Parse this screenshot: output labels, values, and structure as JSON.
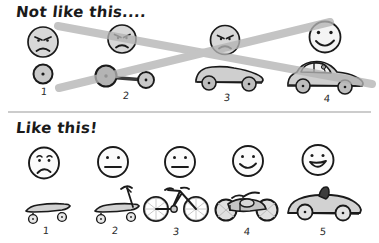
{
  "figure": {
    "title_top": "Not like this....",
    "title_bottom": "Like this!",
    "background_color": "#ffffff",
    "ink_color": "#1a1a1a",
    "fill_gray": "#bdbdbd",
    "cross_color": "#b4b4b4",
    "divider_color": "#9a9a9a"
  },
  "top_row": {
    "heading": "Not like this....",
    "crossed_out": true,
    "items": [
      {
        "number": "1",
        "vehicle": "single-wheel",
        "face": "angry",
        "face_icon": "angry-face-icon"
      },
      {
        "number": "2",
        "vehicle": "axle-two-wheels",
        "face": "angry",
        "face_icon": "angry-face-icon"
      },
      {
        "number": "3",
        "vehicle": "car-chassis",
        "face": "angry",
        "face_icon": "angry-face-icon"
      },
      {
        "number": "4",
        "vehicle": "finished-car",
        "face": "happy",
        "face_icon": "happy-face-icon"
      }
    ]
  },
  "bottom_row": {
    "heading": "Like this!",
    "crossed_out": false,
    "items": [
      {
        "number": "1",
        "vehicle": "skateboard",
        "face": "sad",
        "face_icon": "sad-face-icon"
      },
      {
        "number": "2",
        "vehicle": "scooter",
        "face": "neutral",
        "face_icon": "neutral-face-icon"
      },
      {
        "number": "3",
        "vehicle": "bicycle",
        "face": "neutral",
        "face_icon": "neutral-face-icon"
      },
      {
        "number": "4",
        "vehicle": "motorcycle",
        "face": "smiling",
        "face_icon": "smiling-face-icon"
      },
      {
        "number": "5",
        "vehicle": "convertible-car",
        "face": "grinning",
        "face_icon": "grinning-face-icon"
      }
    ]
  }
}
